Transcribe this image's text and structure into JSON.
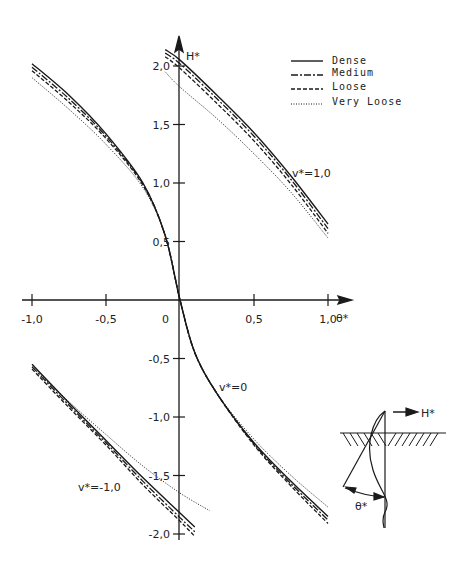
{
  "chart_data": {
    "type": "line",
    "title": "",
    "xlabel": "θ*",
    "ylabel": "H*",
    "xlim": [
      -1.0,
      1.0
    ],
    "ylim": [
      -2.0,
      2.0
    ],
    "grid": false,
    "legend_position": "top-right",
    "x_ticks": [
      "-1,0",
      "-0,5",
      "0",
      "0,5",
      "1,0"
    ],
    "y_ticks": [
      "2,0",
      "1,5",
      "1,0",
      "0,5",
      "-0,5",
      "-1,0",
      "-1,5",
      "-2,0"
    ],
    "legend": [
      "Dense",
      "Medium",
      "Loose",
      "Very Loose"
    ],
    "annotations": [
      "v*=1,0",
      "v*=0",
      "v*=-1,0"
    ],
    "groups": [
      {
        "name": "v*=1,0",
        "series": [
          {
            "name": "Dense",
            "x": [
              -0.1,
              0.0,
              0.25,
              0.5,
              0.75,
              1.0
            ],
            "y": [
              2.14,
              2.05,
              1.75,
              1.43,
              1.06,
              0.65
            ]
          },
          {
            "name": "Medium",
            "x": [
              -0.1,
              0.0,
              0.25,
              0.5,
              0.75,
              1.0
            ],
            "y": [
              2.11,
              2.02,
              1.72,
              1.4,
              1.03,
              0.61
            ]
          },
          {
            "name": "Loose",
            "x": [
              -0.1,
              0.0,
              0.25,
              0.5,
              0.75,
              1.0
            ],
            "y": [
              2.08,
              1.98,
              1.68,
              1.36,
              0.99,
              0.57
            ]
          },
          {
            "name": "Very Loose",
            "x": [
              -0.1,
              0.0,
              0.25,
              0.5,
              0.75,
              1.0
            ],
            "y": [
              1.95,
              1.82,
              1.55,
              1.25,
              0.92,
              0.53
            ]
          }
        ]
      },
      {
        "name": "v*=0",
        "series": [
          {
            "name": "Dense",
            "x": [
              -1.0,
              -0.75,
              -0.5,
              -0.25,
              -0.1,
              0.0,
              0.1,
              0.25,
              0.5,
              0.75,
              1.0
            ],
            "y": [
              2.02,
              1.75,
              1.42,
              1.0,
              0.55,
              0.0,
              -0.45,
              -0.8,
              -1.22,
              -1.55,
              -1.85
            ]
          },
          {
            "name": "Medium",
            "x": [
              -1.0,
              -0.75,
              -0.5,
              -0.25,
              -0.1,
              0.0,
              0.1,
              0.25,
              0.5,
              0.75,
              1.0
            ],
            "y": [
              1.99,
              1.72,
              1.4,
              0.99,
              0.55,
              0.0,
              -0.45,
              -0.8,
              -1.23,
              -1.57,
              -1.88
            ]
          },
          {
            "name": "Loose",
            "x": [
              -1.0,
              -0.75,
              -0.5,
              -0.25,
              -0.1,
              0.0,
              0.1,
              0.25,
              0.5,
              0.75,
              1.0
            ],
            "y": [
              1.96,
              1.69,
              1.38,
              0.98,
              0.55,
              0.0,
              -0.45,
              -0.8,
              -1.24,
              -1.59,
              -1.91
            ]
          },
          {
            "name": "Very Loose",
            "x": [
              -1.0,
              -0.75,
              -0.5,
              -0.25,
              -0.1,
              0.0,
              0.1,
              0.25,
              0.5,
              0.75,
              1.0
            ],
            "y": [
              1.9,
              1.63,
              1.33,
              0.96,
              0.55,
              0.0,
              -0.45,
              -0.8,
              -1.19,
              -1.5,
              -1.77
            ]
          }
        ]
      },
      {
        "name": "v*=-1,0",
        "series": [
          {
            "name": "Dense",
            "x": [
              -1.0,
              -0.75,
              -0.5,
              -0.25,
              0.0,
              0.1
            ],
            "y": [
              -0.55,
              -0.88,
              -1.2,
              -1.52,
              -1.82,
              -1.94
            ]
          },
          {
            "name": "Medium",
            "x": [
              -1.0,
              -0.75,
              -0.5,
              -0.25,
              0.0,
              0.1
            ],
            "y": [
              -0.57,
              -0.9,
              -1.22,
              -1.55,
              -1.86,
              -1.98
            ]
          },
          {
            "name": "Loose",
            "x": [
              -1.0,
              -0.75,
              -0.5,
              -0.25,
              0.0,
              0.1
            ],
            "y": [
              -0.59,
              -0.92,
              -1.24,
              -1.58,
              -1.89,
              -2.02
            ]
          },
          {
            "name": "Very Loose",
            "x": [
              -1.0,
              -0.75,
              -0.5,
              -0.25,
              0.0,
              0.2
            ],
            "y": [
              -0.57,
              -0.87,
              -1.15,
              -1.42,
              -1.65,
              -1.8
            ]
          }
        ]
      }
    ]
  },
  "axes": {
    "x_label": "θ*",
    "y_label": "H*",
    "x_ticks": [
      {
        "value": -1.0,
        "label": "-1,0"
      },
      {
        "value": -0.5,
        "label": "-0,5"
      },
      {
        "value": 0.5,
        "label": "0,5"
      },
      {
        "value": 1.0,
        "label": "1,0"
      }
    ],
    "origin_label": "0",
    "y_ticks": [
      {
        "value": 2.0,
        "label": "2,0"
      },
      {
        "value": 1.5,
        "label": "1,5"
      },
      {
        "value": 1.0,
        "label": "1,0"
      },
      {
        "value": 0.5,
        "label": "0,5"
      },
      {
        "value": -0.5,
        "label": "-0,5"
      },
      {
        "value": -1.0,
        "label": "-1,0"
      },
      {
        "value": -1.5,
        "label": "-1,5"
      },
      {
        "value": -2.0,
        "label": "-2,0"
      }
    ]
  },
  "legend": {
    "items": [
      {
        "label": "Dense",
        "style": "solid"
      },
      {
        "label": "Medium",
        "style": "dash-dot"
      },
      {
        "label": "Loose",
        "style": "dashed"
      },
      {
        "label": "Very Loose",
        "style": "dotted"
      }
    ]
  },
  "annotations": {
    "v_pos": "v*=1,0",
    "v_zero": "v*=0",
    "v_neg": "v*=-1,0"
  },
  "inset": {
    "force_label": "H*",
    "angle_label": "θ*"
  },
  "colors": {
    "ink": "#1a1a1a",
    "background": "#ffffff"
  }
}
